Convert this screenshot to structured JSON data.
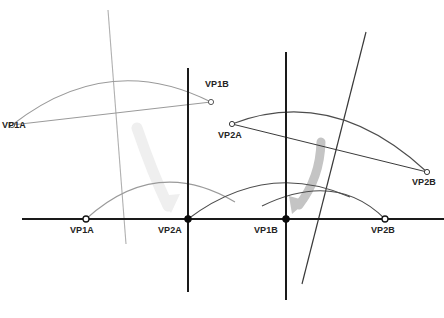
{
  "diagram": {
    "type": "geometric-diagram",
    "canvas": {
      "width": 444,
      "height": 318,
      "background": "#ffffff"
    },
    "colors": {
      "baseline": "#1a1a1a",
      "vertical_axis": "#1a1a1a",
      "arc_light": "#9a9a9a",
      "arc_dark": "#4d4d4d",
      "oblique_light": "#b0b0b0",
      "oblique_dark": "#3a3a3a",
      "arrow_light": "#ededed",
      "arrow_mid": "#c0c0c0",
      "marker_stroke": "#1a1a1a",
      "marker_open_fill": "#ffffff",
      "marker_closed_fill": "#0d0d0d",
      "label_text": "#232323"
    },
    "labels": [
      {
        "id": "vp1a-upper",
        "text": "VP1A",
        "x": 2,
        "y": 128,
        "anchor": "start"
      },
      {
        "id": "vp1b-upper",
        "text": "VP1B",
        "x": 205,
        "y": 80,
        "anchor": "start"
      },
      {
        "id": "vp2a-upper",
        "text": "VP2A",
        "x": 218,
        "y": 131,
        "anchor": "start"
      },
      {
        "id": "vp2b-upper",
        "text": "VP2B",
        "x": 412,
        "y": 178,
        "anchor": "start"
      },
      {
        "id": "vp1a-base",
        "text": "VP1A",
        "x": 70,
        "y": 226,
        "anchor": "start"
      },
      {
        "id": "vp2a-base",
        "text": "VP2A",
        "x": 158,
        "y": 226,
        "anchor": "start"
      },
      {
        "id": "vp1b-base",
        "text": "VP1B",
        "x": 254,
        "y": 226,
        "anchor": "start"
      },
      {
        "id": "vp2b-base",
        "text": "VP2B",
        "x": 371,
        "y": 226,
        "anchor": "start"
      }
    ],
    "points": [
      {
        "id": "vp1a-upper-marker",
        "x": 12,
        "y": 125,
        "style": "open",
        "r": 2.6
      },
      {
        "id": "vp1b-upper-marker",
        "x": 211,
        "y": 102,
        "style": "open",
        "r": 2.6
      },
      {
        "id": "vp2a-upper-marker",
        "x": 232,
        "y": 124,
        "style": "open",
        "r": 2.6
      },
      {
        "id": "vp2b-upper-marker",
        "x": 427,
        "y": 172,
        "style": "open",
        "r": 2.6
      },
      {
        "id": "vp1a-base-marker",
        "x": 86,
        "y": 219,
        "style": "open",
        "r": 3.0
      },
      {
        "id": "vp2a-base-marker",
        "x": 188,
        "y": 219,
        "style": "closed",
        "r": 3.4
      },
      {
        "id": "vp1b-base-marker",
        "x": 286,
        "y": 219,
        "style": "closed",
        "r": 3.4
      },
      {
        "id": "vp2b-base-marker",
        "x": 385,
        "y": 219,
        "style": "open",
        "r": 3.0
      }
    ],
    "baseline": {
      "id": "horizon-line",
      "x1": 22,
      "y1": 219,
      "x2": 444,
      "y2": 219,
      "width": 2.1
    },
    "vertical_axes": [
      {
        "id": "vertical-axis-left",
        "x": 188,
        "y1": 68,
        "y2": 292,
        "width": 2.0
      },
      {
        "id": "vertical-axis-right",
        "x": 286,
        "y1": 52,
        "y2": 300,
        "width": 2.0
      }
    ],
    "oblique_lines": [
      {
        "id": "oblique-left",
        "x1": 108,
        "y1": 10,
        "x2": 126,
        "y2": 244,
        "color": "#b0b0b0",
        "width": 1.1
      },
      {
        "id": "oblique-right",
        "x1": 366,
        "y1": 32,
        "x2": 302,
        "y2": 284,
        "color": "#3a3a3a",
        "width": 1.2
      }
    ],
    "arcs": [
      {
        "id": "arc-upper-left",
        "from": "vp1a-upper",
        "x1": 12,
        "y1": 125,
        "cx": 108,
        "cy": 50,
        "x2": 211,
        "y2": 102,
        "color": "#9a9a9a",
        "width": 1.1
      },
      {
        "id": "arc-upper-right",
        "from": "vp2a-upper",
        "x1": 232,
        "y1": 124,
        "cx": 333,
        "cy": 85,
        "x2": 427,
        "y2": 172,
        "color": "#4d4d4d",
        "width": 1.1
      },
      {
        "id": "arc-lower-left",
        "from": "vp1a-base",
        "x1": 86,
        "y1": 219,
        "cx": 158,
        "cy": 157,
        "x2": 232,
        "y2": 203,
        "color": "#9a9a9a",
        "width": 1.1
      },
      {
        "id": "arc-lower-right",
        "from": "vp2a-base",
        "x1": 188,
        "y1": 219,
        "cx": 268,
        "cy": 163,
        "x2": 346,
        "y2": 196,
        "color": "#4d4d4d",
        "width": 1.1
      },
      {
        "id": "arc-lower-far",
        "from": "vp1b-base",
        "x1": 268,
        "y1": 208,
        "cx": 340,
        "cy": 172,
        "x2": 385,
        "y2": 219,
        "color": "#4d4d4d",
        "width": 1.1
      }
    ],
    "chords": [
      {
        "id": "chord-upper-left",
        "x1": 12,
        "y1": 125,
        "x2": 211,
        "y2": 102,
        "color": "#9a9a9a",
        "width": 1.0
      },
      {
        "id": "chord-upper-right",
        "x1": 232,
        "y1": 124,
        "x2": 427,
        "y2": 172,
        "color": "#3a3a3a",
        "width": 1.0
      }
    ],
    "arrows": [
      {
        "id": "projection-arrow-left",
        "x1": 137,
        "y1": 128,
        "cx": 152,
        "cy": 172,
        "x2": 172,
        "y2": 210,
        "color": "#ededed",
        "width": 9
      },
      {
        "id": "projection-arrow-right",
        "x1": 320,
        "y1": 142,
        "cx": 318,
        "cy": 180,
        "x2": 293,
        "y2": 211,
        "color": "#c0c0c0",
        "width": 8
      }
    ]
  }
}
